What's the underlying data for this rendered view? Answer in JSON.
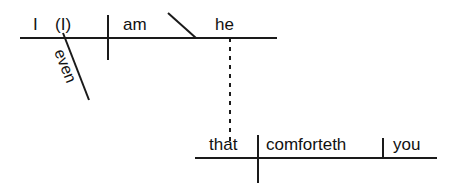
{
  "diagram": {
    "type": "reed-kellogg-sentence-diagram",
    "canvas": {
      "width": 461,
      "height": 194,
      "background": "#ffffff"
    },
    "line_color": "#1a1a1a",
    "main_clause": {
      "subject": "I",
      "subject_appositive": "(I)",
      "verb": "am",
      "predicate_nominative": "he",
      "modifier": "even"
    },
    "subordinate_clause": {
      "relative_pronoun": "that",
      "verb": "comforteth",
      "direct_object": "you"
    }
  }
}
